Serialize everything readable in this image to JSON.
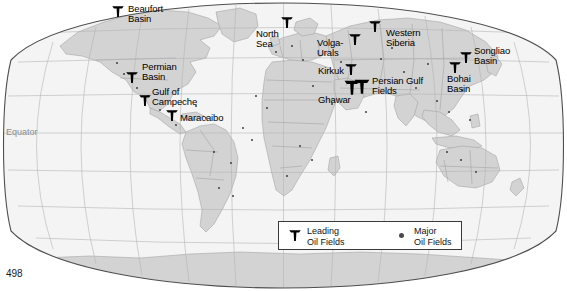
{
  "page": {
    "number": "498",
    "width": 567,
    "height": 291
  },
  "map": {
    "projection": "robinson-oval",
    "equator_label": "Equator",
    "colors": {
      "ocean": "#f4f4f4",
      "land": "#d3d3d3",
      "border": "#8a8a8a",
      "graticule": "#b6b6b6",
      "outline": "#5a5a5a",
      "marker": "#000000",
      "dot": "#3f3f3f",
      "equator_text": "#8b8b8b"
    }
  },
  "labels": [
    {
      "id": "beaufort-basin",
      "text": "Beaufort\nBasin",
      "x": 128,
      "y": 4,
      "marker_x": 118,
      "marker_y": 16,
      "marker": "derrick",
      "size": "sm"
    },
    {
      "id": "permian-basin",
      "text": "Permian\nBasin",
      "x": 142,
      "y": 62,
      "marker_x": 132,
      "marker_y": 82,
      "marker": "derrick",
      "size": "sm"
    },
    {
      "id": "gulf-of-campeche",
      "text": "Gulf of\nCampeche",
      "x": 152,
      "y": 87,
      "marker_x": 145,
      "marker_y": 105,
      "marker": "derrick",
      "size": "sm"
    },
    {
      "id": "maracaibo",
      "text": "Maracaibo",
      "x": 180,
      "y": 113,
      "marker_x": 172,
      "marker_y": 120,
      "marker": "derrick",
      "size": "sm"
    },
    {
      "id": "north-sea",
      "text": "North\nSea",
      "x": 256,
      "y": 29,
      "marker_x": 287,
      "marker_y": 27,
      "marker": "derrick",
      "size": "sm"
    },
    {
      "id": "volga-urals",
      "text": "Volga-\nUrals",
      "x": 317,
      "y": 38,
      "marker_x": 355,
      "marker_y": 44,
      "marker": "derrick",
      "size": "sm"
    },
    {
      "id": "western-siberia",
      "text": "Western\nSiberia",
      "x": 386,
      "y": 28,
      "marker_x": 375,
      "marker_y": 31,
      "marker": "derrick",
      "size": "sm"
    },
    {
      "id": "kirkuk",
      "text": "Kirkuk",
      "x": 318,
      "y": 66,
      "marker_x": 351,
      "marker_y": 74,
      "marker": "derrick",
      "size": "sm"
    },
    {
      "id": "persian-gulf",
      "text": "Persian Gulf\nFields",
      "x": 372,
      "y": 76,
      "marker_x": 362,
      "marker_y": 92,
      "marker": "derrick",
      "size": "lg"
    },
    {
      "id": "ghawar",
      "text": "Ghawar",
      "x": 318,
      "y": 95,
      "marker_x": 352,
      "marker_y": 93,
      "marker": "derrick",
      "size": "lg"
    },
    {
      "id": "songliao-basin",
      "text": "Songliao\nBasin",
      "x": 474,
      "y": 46,
      "marker_x": 466,
      "marker_y": 62,
      "marker": "derrick",
      "size": "sm"
    },
    {
      "id": "bohai-basin",
      "text": "Bohai\nBasin",
      "x": 447,
      "y": 74,
      "marker_x": 455,
      "marker_y": 72,
      "marker": "derrick",
      "size": "sm"
    }
  ],
  "major_field_dots": [
    {
      "x": 117,
      "y": 63
    },
    {
      "x": 124,
      "y": 74
    },
    {
      "x": 137,
      "y": 88
    },
    {
      "x": 148,
      "y": 96
    },
    {
      "x": 160,
      "y": 110
    },
    {
      "x": 176,
      "y": 125
    },
    {
      "x": 196,
      "y": 106
    },
    {
      "x": 206,
      "y": 118
    },
    {
      "x": 214,
      "y": 152
    },
    {
      "x": 231,
      "y": 163
    },
    {
      "x": 219,
      "y": 188
    },
    {
      "x": 233,
      "y": 196
    },
    {
      "x": 256,
      "y": 96
    },
    {
      "x": 267,
      "y": 108
    },
    {
      "x": 276,
      "y": 52
    },
    {
      "x": 292,
      "y": 46
    },
    {
      "x": 303,
      "y": 60
    },
    {
      "x": 313,
      "y": 86
    },
    {
      "x": 332,
      "y": 104
    },
    {
      "x": 341,
      "y": 62
    },
    {
      "x": 366,
      "y": 112
    },
    {
      "x": 381,
      "y": 59
    },
    {
      "x": 392,
      "y": 48
    },
    {
      "x": 404,
      "y": 72
    },
    {
      "x": 416,
      "y": 88
    },
    {
      "x": 428,
      "y": 64
    },
    {
      "x": 437,
      "y": 101
    },
    {
      "x": 449,
      "y": 112
    },
    {
      "x": 462,
      "y": 90
    },
    {
      "x": 470,
      "y": 120
    },
    {
      "x": 447,
      "y": 152
    },
    {
      "x": 461,
      "y": 160
    },
    {
      "x": 476,
      "y": 172
    },
    {
      "x": 300,
      "y": 146
    },
    {
      "x": 312,
      "y": 160
    },
    {
      "x": 287,
      "y": 176
    },
    {
      "x": 252,
      "y": 140
    },
    {
      "x": 243,
      "y": 128
    }
  ],
  "legend": {
    "entries": [
      {
        "id": "leading-oil-fields",
        "label": "Leading\nOil Fields",
        "marker": "derrick"
      },
      {
        "id": "major-oil-fields",
        "label": "Major\nOil Fields",
        "marker": "dot"
      }
    ]
  }
}
